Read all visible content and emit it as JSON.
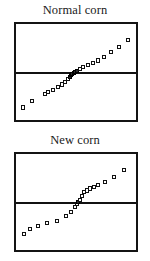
{
  "figure": {
    "caption_top": "Normal corn",
    "caption_bottom": "New corn",
    "marker_style": "open-square",
    "line_color": "#111111",
    "frame_color": "#141414",
    "marker_fill": "#ffffff",
    "marker_stroke": "#111111",
    "background": "#ffffff"
  },
  "chart_data": [
    {
      "type": "scatter",
      "title": "Normal corn",
      "subtitle": "",
      "xlabel": "",
      "ylabel": "",
      "xlim": [
        0,
        100
      ],
      "ylim": [
        0,
        100
      ],
      "grid": false,
      "legend": null,
      "legend_position": "none",
      "annotations": [],
      "reference_line": {
        "orientation": "horizontal",
        "y": 50,
        "x_start": 0,
        "x_end": 100,
        "style": "solid",
        "width_px": 2.4,
        "color": "#111111"
      },
      "series": [
        {
          "name": "Normal corn quantiles",
          "marker": "open-square",
          "x": [
            6,
            13,
            24,
            27,
            31,
            35,
            38,
            41,
            43,
            45,
            46,
            47,
            48,
            49,
            51,
            53,
            56,
            60,
            64,
            68,
            73,
            79,
            86,
            93
          ],
          "y": [
            13,
            20,
            27,
            29,
            31,
            34,
            37,
            40,
            43,
            45,
            47,
            48,
            49,
            50,
            51,
            53,
            55,
            57,
            59,
            62,
            66,
            71,
            76,
            83
          ]
        }
      ]
    },
    {
      "type": "scatter",
      "title": "New corn",
      "subtitle": "",
      "xlabel": "",
      "ylabel": "",
      "xlim": [
        0,
        100
      ],
      "ylim": [
        0,
        100
      ],
      "grid": false,
      "legend": null,
      "legend_position": "none",
      "annotations": [],
      "reference_line": {
        "orientation": "horizontal",
        "y": 50,
        "x_start": 0,
        "x_end": 100,
        "style": "solid",
        "width_px": 2.4,
        "color": "#111111"
      },
      "series": [
        {
          "name": "New corn quantiles",
          "marker": "open-square",
          "x": [
            7,
            12,
            18,
            26,
            34,
            42,
            46,
            49,
            51,
            52,
            53,
            55,
            57,
            59,
            62,
            65,
            68,
            74,
            82,
            90
          ],
          "y": [
            17,
            22,
            25,
            28,
            30,
            35,
            40,
            45,
            48,
            50,
            52,
            56,
            60,
            62,
            64,
            66,
            68,
            71,
            76,
            83
          ]
        }
      ]
    }
  ]
}
